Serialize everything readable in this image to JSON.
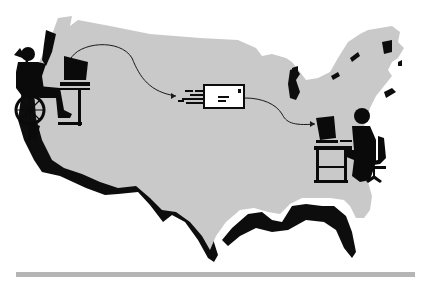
{
  "illustration": {
    "subject": "electronic mail sent across the United States",
    "map": {
      "label": "continental-us-map"
    },
    "sender": {
      "label": "wheelchair-user-at-computer",
      "position": "west-coast"
    },
    "message": {
      "label": "speeding-envelope"
    },
    "receiver": {
      "label": "person-at-desk-computer",
      "position": "east-coast"
    }
  },
  "colors": {
    "background": "#ffffff",
    "map_fill": "#c9c9c9",
    "shadow": "#0d0d0d",
    "figure": "#0a0a0a",
    "envelope_fill": "#ffffff",
    "arrow": "#1a1a1a",
    "rule": "#b5b5b5"
  }
}
